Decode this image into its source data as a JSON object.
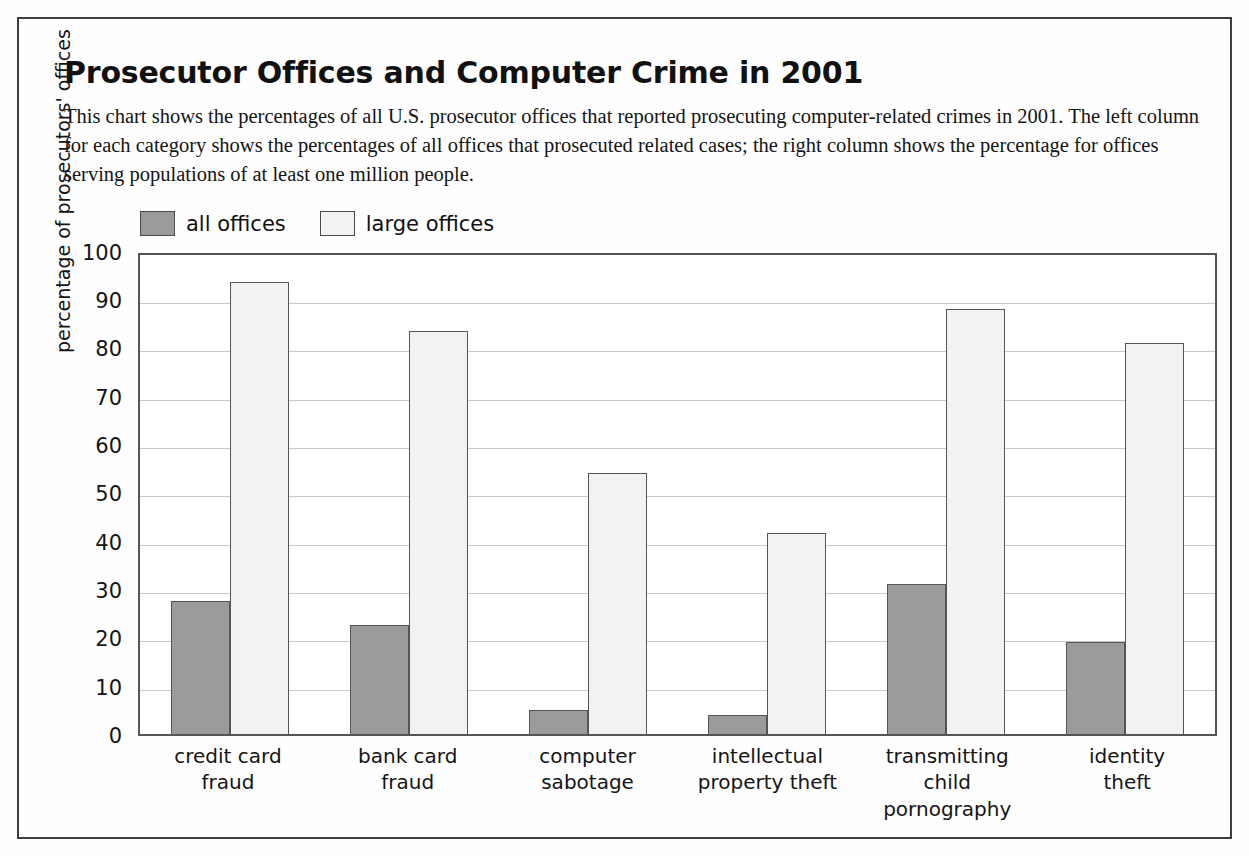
{
  "title": "Prosecutor Offices and Computer Crime in 2001",
  "description": "This chart shows the percentages of all U.S. prosecutor offices that reported prosecuting computer-related crimes in 2001. The left column for each category shows the percentages of all offices that prosecuted related cases; the right column shows the percentage for offices serving populations of at least one million people.",
  "legend": {
    "items": [
      {
        "label": "all offices",
        "color": "#9b9b9b"
      },
      {
        "label": "large offices",
        "color": "#f2f2f2"
      }
    ]
  },
  "chart_data": {
    "type": "bar",
    "title": "Prosecutor Offices and Computer Crime in 2001",
    "xlabel": "",
    "ylabel": "percentage of prosecutors' offices",
    "ylim": [
      0,
      100
    ],
    "ytick_step": 10,
    "yticks": [
      100,
      90,
      80,
      70,
      60,
      50,
      40,
      30,
      20,
      10,
      0
    ],
    "grid": true,
    "legend_position": "above-plot-left",
    "categories": [
      "credit card\nfraud",
      "bank card\nfraud",
      "computer\nsabotage",
      "intellectual\nproperty theft",
      "transmitting\nchild pornography",
      "identity\ntheft"
    ],
    "series": [
      {
        "name": "all offices",
        "color": "#9b9b9b",
        "values": [
          27.5,
          22.5,
          5,
          4,
          31,
          19
        ]
      },
      {
        "name": "large offices",
        "color": "#f2f2f2",
        "values": [
          93.5,
          83.5,
          54,
          41.5,
          88,
          81
        ]
      }
    ]
  }
}
